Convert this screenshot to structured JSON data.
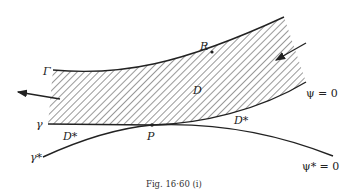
{
  "figure": {
    "caption": "Fig. 16·60 (i)",
    "labels": {
      "Gamma": "Γ",
      "R": "R",
      "D": "D",
      "gamma": "γ",
      "gamma_star": "γ*",
      "D_star_left": "D*",
      "D_star_right": "D*",
      "P": "P",
      "psi_zero": "ψ = 0",
      "psi_star_zero": "ψ* = 0"
    },
    "colors": {
      "ink": "#222222",
      "background": "#ffffff"
    }
  }
}
